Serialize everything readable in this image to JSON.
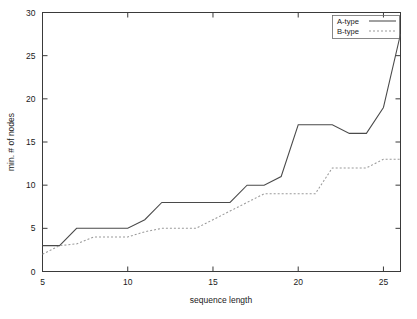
{
  "chart_data": {
    "type": "line",
    "title": "",
    "xlabel": "sequence length",
    "ylabel": "min. # of nodes",
    "xlim": [
      5,
      26
    ],
    "ylim": [
      0,
      30
    ],
    "xticks": [
      5,
      10,
      15,
      20,
      25
    ],
    "yticks": [
      0,
      5,
      10,
      15,
      20,
      25,
      30
    ],
    "xtick_labels": [
      "5",
      "10",
      "15",
      "20",
      "25"
    ],
    "ytick_labels": [
      "0",
      "5",
      "10",
      "15",
      "20",
      "25",
      "30"
    ],
    "grid": false,
    "legend_position": "top-right",
    "x": [
      5,
      6,
      7,
      8,
      9,
      10,
      11,
      12,
      13,
      14,
      15,
      16,
      17,
      18,
      19,
      20,
      21,
      22,
      23,
      24,
      25,
      26
    ],
    "series": [
      {
        "name": "A-type",
        "style": "solid",
        "color": "#4a4a4a",
        "values": [
          3,
          3,
          5,
          5,
          5,
          5,
          6,
          8,
          8,
          8,
          8,
          8,
          10,
          10,
          11,
          17,
          17,
          17,
          16,
          16,
          19,
          27.5
        ]
      },
      {
        "name": "B-type",
        "style": "dotted",
        "color": "#9a9a9a",
        "values": [
          2,
          3,
          3.2,
          4,
          4,
          4,
          4.6,
          5,
          5,
          5,
          6,
          7,
          8,
          9,
          9,
          9,
          9,
          12,
          12,
          12,
          13,
          13
        ]
      }
    ]
  },
  "legend": {
    "entries": [
      {
        "label": "A-type"
      },
      {
        "label": "B-type"
      }
    ]
  }
}
